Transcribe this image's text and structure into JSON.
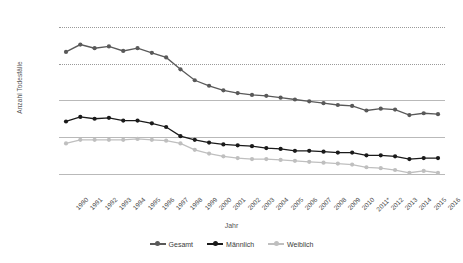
{
  "chart_data": {
    "type": "line",
    "title": "",
    "xlabel": "Jahr",
    "ylabel": "Anzahl Todesfälle",
    "ylim": [
      10000,
      105000
    ],
    "yticks": [
      20000,
      40000,
      60000,
      80000,
      100000
    ],
    "ytick_labels": [
      "20.000",
      "40.000",
      "60.000",
      "80.000",
      "100.000"
    ],
    "grid": true,
    "legend_position": "bottom",
    "categories": [
      "1990",
      "1991",
      "1992",
      "1993",
      "1994",
      "1995",
      "1996",
      "1997",
      "1998",
      "1999",
      "2000",
      "2001",
      "2002",
      "2003",
      "2004",
      "2005",
      "2006",
      "2007",
      "2008",
      "2009",
      "2010",
      "2011*",
      "2012",
      "2013",
      "2014",
      "2015",
      "2016"
    ],
    "series": [
      {
        "name": "Gesamt",
        "color": "#595959",
        "values": [
          86500,
          90500,
          88500,
          89500,
          87000,
          88500,
          86000,
          83500,
          77000,
          71000,
          68000,
          65500,
          64000,
          63000,
          62500,
          61500,
          60500,
          59500,
          58500,
          57500,
          57000,
          54500,
          55500,
          55000,
          52000,
          53000,
          52500
        ]
      },
      {
        "name": "Männlich",
        "color": "#1a1a1a",
        "values": [
          48500,
          51000,
          50000,
          50500,
          49000,
          49000,
          47500,
          45500,
          40500,
          38500,
          37000,
          36000,
          35500,
          35000,
          34000,
          33500,
          32500,
          32500,
          32000,
          31500,
          31500,
          30000,
          30000,
          29500,
          28000,
          28500,
          28500
        ]
      },
      {
        "name": "Weiblich",
        "color": "#bfbfbf",
        "values": [
          36500,
          38500,
          38500,
          38500,
          38500,
          39000,
          38500,
          38000,
          36500,
          33000,
          31000,
          29500,
          28500,
          28000,
          28000,
          27500,
          27000,
          26500,
          26000,
          25500,
          25000,
          23500,
          23000,
          22000,
          20500,
          21500,
          20500
        ]
      }
    ]
  },
  "legend": {
    "items": [
      {
        "label": "Gesamt"
      },
      {
        "label": "Männlich"
      },
      {
        "label": "Weiblich"
      }
    ]
  }
}
